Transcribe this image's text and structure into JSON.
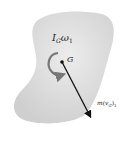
{
  "diagram": {
    "body_color": "#dcdcdc",
    "arrow_color": "#111111",
    "angular_momentum": {
      "symbol": "I",
      "sub": "G",
      "omega": "ω",
      "omega_sub": "1"
    },
    "center_of_mass": {
      "label": "G"
    },
    "linear_momentum": {
      "prefix": "m(",
      "v": "v",
      "sub": "G",
      "suffix": ")",
      "outer_sub": "1"
    }
  }
}
